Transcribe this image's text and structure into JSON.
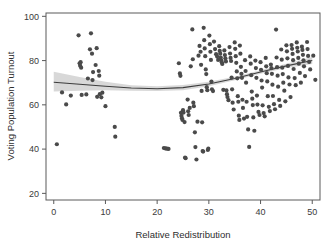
{
  "figure": {
    "background_color": "#ffffff",
    "plot_background_color": "#ffffff",
    "frame_color": "#5a5a5a"
  },
  "chart_data": {
    "type": "scatter",
    "title": "",
    "subtitle": "",
    "xlabel": "Relative Redistribution",
    "ylabel": "Voting Population Turnout",
    "xlim": [
      -1.5,
      51.5
    ],
    "ylim": [
      17,
      101.5
    ],
    "xticks": [
      0,
      10,
      20,
      30,
      40,
      50
    ],
    "xtick_labels": [
      "0",
      "10",
      "20",
      "30",
      "40",
      "50"
    ],
    "yticks": [
      20,
      40,
      60,
      80,
      100
    ],
    "ytick_labels": [
      "20",
      "40",
      "60",
      "80",
      "100"
    ],
    "grid": false,
    "legend": false,
    "legend_position": "none",
    "point_color": "#4a4a4a",
    "point_size": 3.1,
    "trend_line_color": "#3d3d3d",
    "confidence_band_color": "#c9c9c9",
    "series": [
      {
        "name": "Countries",
        "marker": "circle",
        "points": [
          [
            0.6,
            42.2
          ],
          [
            1.6,
            65.6
          ],
          [
            2.4,
            60.2
          ],
          [
            3.3,
            64.2
          ],
          [
            4.8,
            91.4
          ],
          [
            5.0,
            78.8
          ],
          [
            5.1,
            77.7
          ],
          [
            5.2,
            79.3
          ],
          [
            5.3,
            76.8
          ],
          [
            5.4,
            64.5
          ],
          [
            6.3,
            64.7
          ],
          [
            6.6,
            71.9
          ],
          [
            7.0,
            85.1
          ],
          [
            7.2,
            92.3
          ],
          [
            7.4,
            83.1
          ],
          [
            7.5,
            71.2
          ],
          [
            7.6,
            74.8
          ],
          [
            8.1,
            78.0
          ],
          [
            8.3,
            85.6
          ],
          [
            8.4,
            63.6
          ],
          [
            8.7,
            75.3
          ],
          [
            8.8,
            73.2
          ],
          [
            8.9,
            64.8
          ],
          [
            9.2,
            63.4
          ],
          [
            9.4,
            65.5
          ],
          [
            10.0,
            59.4
          ],
          [
            11.8,
            50.0
          ],
          [
            11.9,
            45.6
          ],
          [
            21.3,
            40.5
          ],
          [
            21.6,
            40.3
          ],
          [
            21.9,
            40.2
          ],
          [
            22.2,
            40.1
          ],
          [
            24.2,
            78.8
          ],
          [
            24.4,
            74.2
          ],
          [
            24.5,
            73.1
          ],
          [
            24.6,
            56.4
          ],
          [
            24.7,
            55.0
          ],
          [
            24.8,
            53.9
          ],
          [
            24.9,
            53.2
          ],
          [
            25.0,
            57.6
          ],
          [
            25.1,
            56.5
          ],
          [
            25.3,
            52.2
          ],
          [
            25.4,
            36.2
          ],
          [
            25.5,
            35.9
          ],
          [
            25.9,
            62.4
          ],
          [
            26.0,
            57.1
          ],
          [
            26.1,
            55.4
          ],
          [
            26.3,
            58.6
          ],
          [
            26.5,
            77.4
          ],
          [
            26.8,
            94.1
          ],
          [
            26.9,
            80.6
          ],
          [
            27.0,
            61.0
          ],
          [
            27.1,
            59.4
          ],
          [
            27.3,
            47.6
          ],
          [
            27.4,
            40.9
          ],
          [
            27.6,
            35.3
          ],
          [
            27.8,
            52.4
          ],
          [
            28.0,
            82.2
          ],
          [
            28.2,
            86.6
          ],
          [
            28.4,
            84.0
          ],
          [
            28.5,
            78.1
          ],
          [
            28.6,
            66.3
          ],
          [
            28.7,
            52.1
          ],
          [
            28.8,
            39.1
          ],
          [
            28.9,
            38.9
          ],
          [
            29.0,
            94.8
          ],
          [
            29.1,
            89.2
          ],
          [
            29.2,
            85.5
          ],
          [
            29.3,
            82.0
          ],
          [
            29.4,
            76.0
          ],
          [
            29.5,
            73.9
          ],
          [
            29.6,
            68.0
          ],
          [
            29.7,
            66.6
          ],
          [
            29.8,
            39.6
          ],
          [
            29.9,
            40.2
          ],
          [
            30.1,
            91.3
          ],
          [
            30.2,
            87.4
          ],
          [
            30.3,
            84.0
          ],
          [
            30.4,
            80.3
          ],
          [
            30.5,
            70.5
          ],
          [
            30.6,
            67.0
          ],
          [
            30.8,
            66.2
          ],
          [
            31.0,
            88.6
          ],
          [
            31.2,
            85.2
          ],
          [
            31.4,
            82.9
          ],
          [
            31.6,
            81.8
          ],
          [
            31.8,
            80.3
          ],
          [
            32.0,
            86.5
          ],
          [
            32.1,
            84.4
          ],
          [
            32.2,
            83.1
          ],
          [
            32.3,
            81.4
          ],
          [
            32.4,
            80.1
          ],
          [
            32.5,
            79.2
          ],
          [
            32.6,
            78.5
          ],
          [
            32.8,
            66.8
          ],
          [
            33.0,
            84.6
          ],
          [
            33.1,
            82.5
          ],
          [
            33.2,
            81.0
          ],
          [
            33.3,
            79.6
          ],
          [
            33.4,
            66.5
          ],
          [
            33.5,
            64.8
          ],
          [
            33.6,
            63.5
          ],
          [
            33.8,
            62.1
          ],
          [
            34.0,
            86.1
          ],
          [
            34.1,
            83.2
          ],
          [
            34.2,
            81.2
          ],
          [
            34.3,
            79.8
          ],
          [
            34.4,
            72.3
          ],
          [
            34.5,
            67.0
          ],
          [
            34.6,
            61.0
          ],
          [
            34.8,
            57.9
          ],
          [
            35.0,
            88.2
          ],
          [
            35.1,
            85.3
          ],
          [
            35.2,
            82.0
          ],
          [
            35.3,
            79.0
          ],
          [
            35.4,
            75.1
          ],
          [
            35.5,
            72.0
          ],
          [
            35.6,
            63.9
          ],
          [
            35.7,
            61.4
          ],
          [
            35.8,
            55.1
          ],
          [
            35.9,
            53.2
          ],
          [
            36.0,
            86.8
          ],
          [
            36.1,
            83.1
          ],
          [
            36.2,
            77.2
          ],
          [
            36.3,
            74.0
          ],
          [
            36.4,
            72.2
          ],
          [
            36.5,
            62.3
          ],
          [
            36.6,
            58.6
          ],
          [
            36.8,
            53.8
          ],
          [
            37.0,
            80.2
          ],
          [
            37.1,
            75.3
          ],
          [
            37.2,
            70.0
          ],
          [
            37.3,
            61.4
          ],
          [
            37.4,
            54.6
          ],
          [
            37.6,
            48.9
          ],
          [
            37.8,
            41.0
          ],
          [
            38.0,
            81.9
          ],
          [
            38.1,
            78.6
          ],
          [
            38.2,
            73.4
          ],
          [
            38.3,
            66.0
          ],
          [
            38.4,
            62.8
          ],
          [
            38.5,
            59.9
          ],
          [
            38.6,
            54.3
          ],
          [
            38.8,
            48.3
          ],
          [
            39.0,
            80.0
          ],
          [
            39.1,
            76.6
          ],
          [
            39.2,
            72.2
          ],
          [
            39.3,
            64.2
          ],
          [
            39.4,
            60.1
          ],
          [
            39.6,
            56.8
          ],
          [
            39.8,
            55.4
          ],
          [
            40.0,
            79.3
          ],
          [
            40.1,
            75.8
          ],
          [
            40.2,
            71.0
          ],
          [
            40.3,
            67.8
          ],
          [
            40.4,
            59.8
          ],
          [
            40.6,
            56.3
          ],
          [
            40.8,
            54.8
          ],
          [
            41.0,
            81.2
          ],
          [
            41.1,
            77.4
          ],
          [
            41.2,
            74.3
          ],
          [
            41.3,
            70.6
          ],
          [
            41.4,
            63.9
          ],
          [
            41.6,
            59.1
          ],
          [
            41.8,
            57.2
          ],
          [
            42.0,
            78.2
          ],
          [
            42.1,
            76.6
          ],
          [
            42.2,
            74.0
          ],
          [
            42.3,
            69.1
          ],
          [
            42.4,
            64.0
          ],
          [
            42.6,
            60.3
          ],
          [
            42.8,
            58.0
          ],
          [
            43.0,
            94.0
          ],
          [
            43.1,
            81.4
          ],
          [
            43.2,
            77.0
          ],
          [
            43.3,
            73.2
          ],
          [
            43.4,
            68.2
          ],
          [
            43.6,
            62.2
          ],
          [
            43.8,
            59.5
          ],
          [
            44.0,
            85.0
          ],
          [
            44.1,
            80.4
          ],
          [
            44.2,
            76.8
          ],
          [
            44.3,
            73.9
          ],
          [
            44.4,
            70.0
          ],
          [
            44.6,
            66.4
          ],
          [
            44.8,
            61.6
          ],
          [
            45.0,
            86.9
          ],
          [
            45.1,
            84.2
          ],
          [
            45.2,
            81.0
          ],
          [
            45.3,
            77.6
          ],
          [
            45.4,
            72.4
          ],
          [
            45.6,
            69.2
          ],
          [
            45.8,
            63.5
          ],
          [
            46.0,
            87.0
          ],
          [
            46.1,
            85.3
          ],
          [
            46.2,
            83.0
          ],
          [
            46.3,
            80.2
          ],
          [
            46.4,
            76.2
          ],
          [
            46.6,
            72.1
          ],
          [
            46.8,
            68.9
          ],
          [
            47.0,
            88.2
          ],
          [
            47.1,
            85.8
          ],
          [
            47.2,
            84.1
          ],
          [
            47.3,
            81.2
          ],
          [
            47.4,
            78.6
          ],
          [
            47.6,
            74.4
          ],
          [
            47.8,
            70.0
          ],
          [
            48.0,
            86.3
          ],
          [
            48.1,
            84.8
          ],
          [
            48.2,
            82.6
          ],
          [
            48.3,
            80.1
          ],
          [
            48.4,
            77.4
          ],
          [
            48.6,
            73.0
          ],
          [
            49.0,
            88.4
          ],
          [
            49.1,
            85.2
          ],
          [
            49.2,
            82.1
          ],
          [
            49.4,
            79.4
          ],
          [
            49.6,
            76.0
          ],
          [
            50.2,
            82.2
          ],
          [
            50.6,
            71.3
          ]
        ]
      }
    ],
    "trend": {
      "name": "smoothed fit",
      "x": [
        0,
        5,
        10,
        15,
        20,
        25,
        30,
        35,
        40,
        45,
        50
      ],
      "y": [
        70.2,
        69.3,
        68.4,
        67.6,
        67.3,
        67.8,
        69.4,
        71.9,
        74.8,
        77.6,
        80.0
      ],
      "ci_lower": [
        66.0,
        66.4,
        66.6,
        66.4,
        66.2,
        66.6,
        68.4,
        71.1,
        74.0,
        76.6,
        78.4
      ],
      "ci_upper": [
        74.9,
        72.6,
        70.4,
        68.9,
        68.4,
        69.0,
        70.4,
        72.7,
        75.6,
        78.6,
        81.6
      ]
    }
  }
}
